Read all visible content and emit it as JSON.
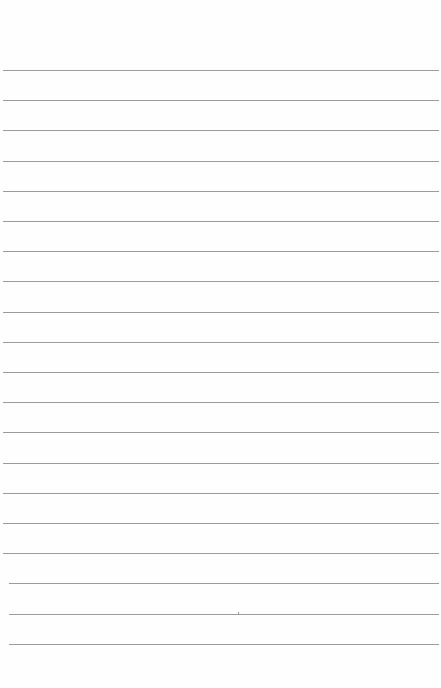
{
  "document": {
    "type": "blank lined paper",
    "background_color": "#fefefe",
    "line_color": "#8a8a8a",
    "line_count": 20,
    "first_line_y": 70,
    "line_spacing": 30.2,
    "lines": [
      {
        "index": 1,
        "text": ""
      },
      {
        "index": 2,
        "text": ""
      },
      {
        "index": 3,
        "text": ""
      },
      {
        "index": 4,
        "text": ""
      },
      {
        "index": 5,
        "text": ""
      },
      {
        "index": 6,
        "text": ""
      },
      {
        "index": 7,
        "text": ""
      },
      {
        "index": 8,
        "text": ""
      },
      {
        "index": 9,
        "text": ""
      },
      {
        "index": 10,
        "text": ""
      },
      {
        "index": 11,
        "text": ""
      },
      {
        "index": 12,
        "text": ""
      },
      {
        "index": 13,
        "text": ""
      },
      {
        "index": 14,
        "text": ""
      },
      {
        "index": 15,
        "text": ""
      },
      {
        "index": 16,
        "text": ""
      },
      {
        "index": 17,
        "text": ""
      },
      {
        "index": 18,
        "text": ""
      },
      {
        "index": 19,
        "text": ""
      },
      {
        "index": 20,
        "text": ""
      }
    ]
  }
}
